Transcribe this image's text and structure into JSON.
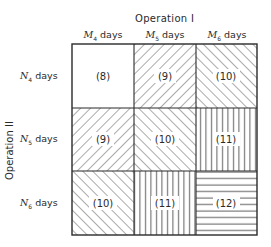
{
  "diagram": {
    "axis_top": {
      "title": "Operation I",
      "columns": [
        {
          "var": "M",
          "sub": "4",
          "unit": "days"
        },
        {
          "var": "M",
          "sub": "5",
          "unit": "days"
        },
        {
          "var": "M",
          "sub": "6",
          "unit": "days"
        }
      ]
    },
    "axis_left": {
      "title": "Operation II",
      "rows": [
        {
          "var": "N",
          "sub": "4",
          "unit": "days"
        },
        {
          "var": "N",
          "sub": "5",
          "unit": "days"
        },
        {
          "var": "N",
          "sub": "6",
          "unit": "days"
        }
      ]
    },
    "cells": [
      [
        {
          "label": "(8)",
          "pattern": "blank"
        },
        {
          "label": "(9)",
          "pattern": "diag-up"
        },
        {
          "label": "(10)",
          "pattern": "diag-down"
        }
      ],
      [
        {
          "label": "(9)",
          "pattern": "diag-up"
        },
        {
          "label": "(10)",
          "pattern": "diag-down"
        },
        {
          "label": "(11)",
          "pattern": "vertical"
        }
      ],
      [
        {
          "label": "(10)",
          "pattern": "diag-down"
        },
        {
          "label": "(11)",
          "pattern": "vertical"
        },
        {
          "label": "(12)",
          "pattern": "horizontal"
        }
      ]
    ],
    "colors": {
      "line": "#2a2a2a",
      "background": "#ffffff"
    }
  }
}
